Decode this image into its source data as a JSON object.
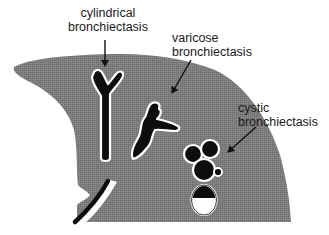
{
  "diagram": {
    "type": "medical illustration",
    "colors": {
      "background": "#ffffff",
      "lung_tissue": "#7d7d7d",
      "airway": "#0d0d0d",
      "airway_outline": "#ffffff",
      "fluid": "#ffffff",
      "text": "#1a1a1a"
    },
    "labels": [
      {
        "id": "cylindrical",
        "line1": "cylindrical",
        "line2": "bronchiectasis"
      },
      {
        "id": "varicose",
        "line1": "varicose",
        "line2": "bronchiectasis"
      },
      {
        "id": "cystic",
        "line1": "cystic",
        "line2": "bronchiectasis"
      }
    ]
  }
}
